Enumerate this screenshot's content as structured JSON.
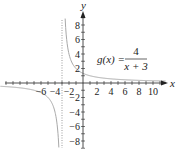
{
  "chart_data": {
    "type": "line",
    "title": "",
    "function_label": "g(x) = 4/(x+3)",
    "formula": {
      "lhs": "g(x) =",
      "numerator": "4",
      "denominator": "x + 3"
    },
    "xlabel": "x",
    "ylabel": "y",
    "xlim": [
      -9,
      11
    ],
    "ylim": [
      -9,
      9
    ],
    "x_ticks": [
      -6,
      -4,
      -2,
      2,
      4,
      6,
      8,
      10
    ],
    "x_tick_labels": [
      "−6",
      "−4",
      "−2",
      "2",
      "4",
      "6",
      "8",
      "10"
    ],
    "y_ticks": [
      8,
      6,
      4,
      2,
      -2,
      -4,
      -6,
      -8
    ],
    "y_tick_labels": [
      "8",
      "6",
      "4",
      "2",
      "−2",
      "−4",
      "−6",
      "−8"
    ],
    "vertical_asymptote": -3,
    "horizontal_asymptote": 0,
    "grid": false,
    "series": [
      {
        "name": "g(x) = 4/(x+3)",
        "branch": "right",
        "x": [
          -2.5,
          -2.2,
          -2.0,
          -1.5,
          -1.0,
          0,
          1,
          2,
          4,
          6,
          8,
          10,
          11.5
        ],
        "y": [
          8,
          5,
          4,
          2.67,
          2,
          1.33,
          1,
          0.8,
          0.57,
          0.44,
          0.36,
          0.31,
          0.28
        ]
      },
      {
        "name": "g(x) = 4/(x+3)",
        "branch": "left",
        "x": [
          -11.5,
          -10,
          -8,
          -6,
          -5,
          -4.5,
          -4,
          -3.8,
          -3.5
        ],
        "y": [
          -0.47,
          -0.57,
          -0.8,
          -1.33,
          -2,
          -2.67,
          -4,
          -5,
          -8
        ]
      }
    ],
    "colors": {
      "axis": "#222222",
      "curve": "#a8a8a8",
      "asymptote": "#9a9a9a"
    }
  }
}
